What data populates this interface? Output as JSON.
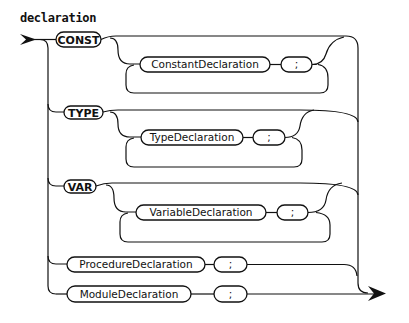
{
  "diagram": {
    "title": "declaration",
    "colors": {
      "stroke": "#111111",
      "background": "#ffffff"
    },
    "branches": [
      {
        "keyword": "CONST",
        "loop": {
          "item": "ConstantDeclaration",
          "separator": ";"
        }
      },
      {
        "keyword": "TYPE",
        "loop": {
          "item": "TypeDeclaration",
          "separator": ";"
        }
      },
      {
        "keyword": "VAR",
        "loop": {
          "item": "VariableDeclaration",
          "separator": ";"
        }
      },
      {
        "item": "ProcedureDeclaration",
        "separator": ";"
      },
      {
        "item": "ModuleDeclaration",
        "separator": ";"
      }
    ],
    "entry_icon": "arrow-right-icon",
    "exit_icon": "arrow-right-icon"
  }
}
